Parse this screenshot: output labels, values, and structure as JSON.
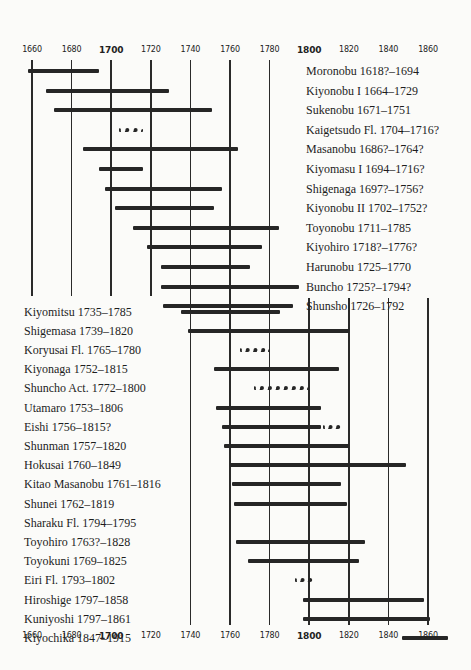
{
  "chart_data": {
    "type": "timeline",
    "title": "",
    "xlabel": "",
    "ylabel": "",
    "xlim": [
      1660,
      1860
    ],
    "x_ticks": [
      1660,
      1680,
      1700,
      1720,
      1740,
      1760,
      1780,
      1800,
      1820,
      1840,
      1860
    ],
    "bold_ticks": [
      1700,
      1800
    ],
    "grid": true,
    "artists": [
      {
        "label": "Moronobu 1618?–1694",
        "start": 1658,
        "end": 1694,
        "style": "solid"
      },
      {
        "label": "Kiyonobu I 1664–1729",
        "start": 1667,
        "end": 1729,
        "style": "solid"
      },
      {
        "label": "Sukenobu 1671–1751",
        "start": 1671,
        "end": 1751,
        "style": "solid"
      },
      {
        "label": "Kaigetsudo Fl. 1704–1716?",
        "start": 1704,
        "end": 1716,
        "style": "dotted"
      },
      {
        "label": "Masanobu 1686?–1764?",
        "start": 1686,
        "end": 1764,
        "style": "solid"
      },
      {
        "label": "Kiyomasu I 1694–1716?",
        "start": 1694,
        "end": 1716,
        "style": "solid"
      },
      {
        "label": "Shigenaga 1697?–1756?",
        "start": 1697,
        "end": 1756,
        "style": "solid"
      },
      {
        "label": "Kiyonobu II 1702–1752?",
        "start": 1702,
        "end": 1752,
        "style": "solid"
      },
      {
        "label": "Toyonobu 1711–1785",
        "start": 1711,
        "end": 1785,
        "style": "solid"
      },
      {
        "label": "Kiyohiro 1718?–1776?",
        "start": 1718,
        "end": 1776,
        "style": "solid"
      },
      {
        "label": "Harunobu 1725–1770",
        "start": 1725,
        "end": 1770,
        "style": "solid"
      },
      {
        "label": "Buncho 1725?–1794?",
        "start": 1725,
        "end": 1795,
        "style": "solid"
      },
      {
        "label": "Shunsho 1726–1792",
        "start": 1726,
        "end": 1792,
        "style": "solid"
      },
      {
        "label": "Kiyomitsu 1735–1785",
        "start": 1735,
        "end": 1785,
        "style": "solid"
      },
      {
        "label": "Shigemasa 1739–1820",
        "start": 1739,
        "end": 1820,
        "style": "solid"
      },
      {
        "label": "Koryusai Fl. 1765–1780",
        "start": 1765,
        "end": 1780,
        "style": "dotted"
      },
      {
        "label": "Kiyonaga 1752–1815",
        "start": 1752,
        "end": 1815,
        "style": "solid"
      },
      {
        "label": "Shuncho Act. 1772–1800",
        "start": 1772,
        "end": 1800,
        "style": "dotted"
      },
      {
        "label": "Utamaro 1753–1806",
        "start": 1753,
        "end": 1806,
        "style": "solid"
      },
      {
        "label": "Eishi 1756–1815?",
        "start": 1756,
        "end": 1806,
        "style": "solid",
        "dotted_to": 1815
      },
      {
        "label": "Shunman 1757–1820",
        "start": 1757,
        "end": 1820,
        "style": "solid"
      },
      {
        "label": "Hokusai 1760–1849",
        "start": 1760,
        "end": 1849,
        "style": "solid"
      },
      {
        "label": "Kitao Masanobu 1761–1816",
        "start": 1761,
        "end": 1816,
        "style": "solid"
      },
      {
        "label": "Shunei 1762–1819",
        "start": 1762,
        "end": 1819,
        "style": "solid"
      },
      {
        "label": "Sharaku Fl. 1794–1795",
        "start": null,
        "end": null,
        "style": "none"
      },
      {
        "label": "Toyohiro 1763?–1828",
        "start": 1763,
        "end": 1828,
        "style": "solid"
      },
      {
        "label": "Toyokuni 1769–1825",
        "start": 1769,
        "end": 1825,
        "style": "solid"
      },
      {
        "label": "Eiri Fl. 1793–1802",
        "start": 1793,
        "end": 1802,
        "style": "dotted"
      },
      {
        "label": "Hiroshige 1797–1858",
        "start": 1797,
        "end": 1858,
        "style": "solid"
      },
      {
        "label": "Kuniyoshi 1797–1861",
        "start": 1797,
        "end": 1861,
        "style": "solid"
      },
      {
        "label": "Kiyochika 1847–1915",
        "start": 1847,
        "end": 1870,
        "style": "solid"
      }
    ]
  }
}
